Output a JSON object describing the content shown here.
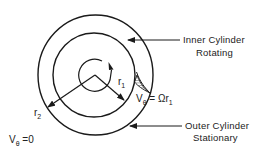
{
  "diagram": {
    "type": "couette-flow-schematic",
    "labels": {
      "inner_cylinder_line1": "Inner Cylinder",
      "inner_cylinder_line2": "Rotating",
      "outer_cylinder_line1": "Outer Cylinder",
      "outer_cylinder_line2": "Stationary",
      "r1_base": "r",
      "r1_sub": "1",
      "r2_base": "r",
      "r2_sub": "2",
      "v_inner_base": "V",
      "v_inner_sub": "θ",
      "v_inner_rhs": " = Ωr",
      "v_inner_rhs_sub": "1",
      "v_outer_base": "V",
      "v_outer_sub": "θ",
      "v_outer_rhs": " =0"
    },
    "shapes": {
      "outer_circle": {
        "cx": 95.5,
        "cy": 75,
        "rx": 57.5,
        "ry": 60
      },
      "inner_circle": {
        "cx": 94,
        "cy": 75,
        "rx": 41,
        "ry": 42
      },
      "rotation_arc_center": [
        95,
        75
      ],
      "stroke_color": "#1a1a1a"
    }
  }
}
